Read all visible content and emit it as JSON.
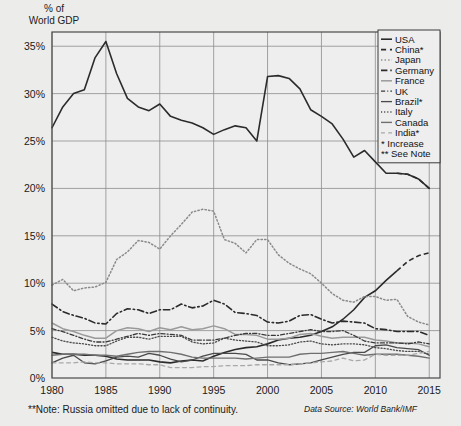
{
  "axis_title": "% of\nWorld GDP",
  "footer": {
    "note": "**Note: Russia omitted due to lack of continuity.",
    "source": "Data Source: World Bank/IMF"
  },
  "legend": {
    "entries": [
      {
        "label": "USA",
        "style": "solid",
        "color": "#2b2b2b",
        "width": 1.6
      },
      {
        "label": "China*",
        "style": "dashed",
        "color": "#2b2b2b",
        "width": 1.6
      },
      {
        "label": "Japan",
        "style": "dotted",
        "color": "#8a8a8a",
        "width": 1.5
      },
      {
        "label": "Germany",
        "style": "dashdot",
        "color": "#2b2b2b",
        "width": 1.6
      },
      {
        "label": "France",
        "style": "solid",
        "color": "#9a9a9a",
        "width": 1.5
      },
      {
        "label": "UK",
        "style": "dashdot2",
        "color": "#3a3a3a",
        "width": 1.3
      },
      {
        "label": "Brazil*",
        "style": "solid",
        "color": "#4a4a4a",
        "width": 1.3
      },
      {
        "label": "Italy",
        "style": "dotted",
        "color": "#4a4a4a",
        "width": 1.3
      },
      {
        "label": "Canada",
        "style": "solid",
        "color": "#6f6f6f",
        "width": 1.4
      },
      {
        "label": "India*",
        "style": "dashed2",
        "color": "#a8a8a8",
        "width": 1.3
      }
    ],
    "notes": [
      "* Increase",
      "** See Note"
    ]
  },
  "colors": {
    "background": "#ececeb",
    "plot_background": "#eeeeee",
    "grid": "#8d8d8d",
    "frame": "#4a4a4a",
    "text": "#1a1a1a"
  },
  "chart_data": {
    "type": "line",
    "title": "% of World GDP",
    "xlabel": "",
    "ylabel": "% of World GDP",
    "xlim": [
      1980,
      2016
    ],
    "ylim": [
      0,
      36.5
    ],
    "xticks": [
      1980,
      1985,
      1990,
      1995,
      2000,
      2005,
      2010,
      2015
    ],
    "yticks": [
      0,
      5,
      10,
      15,
      20,
      25,
      30,
      35
    ],
    "ytick_labels": [
      "0%",
      "5%",
      "10%",
      "15%",
      "20%",
      "25%",
      "30%",
      "35%"
    ],
    "grid": true,
    "legend_position": "top-right",
    "annotations": [
      "* Increase",
      "** See Note"
    ],
    "series": [
      {
        "name": "USA",
        "style": "solid",
        "x": [
          1980,
          1981,
          1982,
          1983,
          1984,
          1985,
          1986,
          1987,
          1988,
          1989,
          1990,
          1991,
          1992,
          1993,
          1994,
          1995,
          1996,
          1997,
          1998,
          1999,
          2000,
          2001,
          2002,
          2003,
          2004,
          2005,
          2006,
          2007,
          2008,
          2009,
          2010,
          2011,
          2012,
          2013,
          2014,
          2015
        ],
        "y": [
          26.4,
          28.6,
          30.0,
          30.4,
          33.8,
          35.5,
          32.1,
          29.5,
          28.6,
          28.2,
          28.9,
          27.6,
          27.2,
          26.9,
          26.4,
          25.7,
          26.2,
          26.6,
          26.4,
          25.0,
          31.8,
          31.9,
          31.6,
          30.5,
          28.3,
          27.6,
          26.8,
          25.2,
          23.3,
          24.0,
          22.8,
          21.6,
          21.6,
          21.5,
          21.0,
          20.0
        ],
        "color": "#2b2b2b"
      },
      {
        "name": "China*",
        "style": "solid-to-dashed",
        "x": [
          1980,
          1981,
          1982,
          1983,
          1984,
          1985,
          1986,
          1987,
          1988,
          1989,
          1990,
          1991,
          1992,
          1993,
          1994,
          1995,
          1996,
          1997,
          1998,
          1999,
          2000,
          2001,
          2002,
          2003,
          2004,
          2005,
          2006,
          2007,
          2008,
          2009,
          2010,
          2011,
          2012,
          2013,
          2014,
          2015
        ],
        "y": [
          2.7,
          2.5,
          2.5,
          2.4,
          2.4,
          2.3,
          2.0,
          1.9,
          1.9,
          1.9,
          1.7,
          1.6,
          1.8,
          1.9,
          1.8,
          2.3,
          2.7,
          3.0,
          3.2,
          3.3,
          3.6,
          4.0,
          4.2,
          4.3,
          4.5,
          4.9,
          5.4,
          6.2,
          7.2,
          8.5,
          9.2,
          10.3,
          11.3,
          12.3,
          12.9,
          13.2
        ],
        "color": "#2b2b2b"
      },
      {
        "name": "Japan",
        "style": "dotted",
        "x": [
          1980,
          1981,
          1982,
          1983,
          1984,
          1985,
          1986,
          1987,
          1988,
          1989,
          1990,
          1991,
          1992,
          1993,
          1994,
          1995,
          1996,
          1997,
          1998,
          1999,
          2000,
          2001,
          2002,
          2003,
          2004,
          2005,
          2006,
          2007,
          2008,
          2009,
          2010,
          2011,
          2012,
          2013,
          2014,
          2015
        ],
        "y": [
          9.8,
          10.4,
          9.2,
          9.5,
          9.6,
          10.1,
          12.5,
          13.3,
          14.5,
          14.3,
          13.6,
          15.0,
          16.2,
          17.5,
          17.8,
          17.6,
          14.6,
          14.2,
          13.2,
          14.6,
          14.6,
          13.0,
          12.1,
          11.5,
          11.0,
          10.0,
          8.9,
          8.2,
          8.0,
          8.6,
          8.6,
          8.2,
          8.3,
          6.5,
          5.9,
          5.6
        ],
        "color": "#8a8a8a"
      },
      {
        "name": "Germany",
        "style": "dashdot",
        "x": [
          1980,
          1981,
          1982,
          1983,
          1984,
          1985,
          1986,
          1987,
          1988,
          1989,
          1990,
          1991,
          1992,
          1993,
          1994,
          1995,
          1996,
          1997,
          1998,
          1999,
          2000,
          2001,
          2002,
          2003,
          2004,
          2005,
          2006,
          2007,
          2008,
          2009,
          2010,
          2011,
          2012,
          2013,
          2014,
          2015
        ],
        "y": [
          7.8,
          7.0,
          6.6,
          6.3,
          5.8,
          5.7,
          6.8,
          7.3,
          7.2,
          6.8,
          7.2,
          7.2,
          7.8,
          7.4,
          7.6,
          8.2,
          7.8,
          6.9,
          6.8,
          6.6,
          5.9,
          5.8,
          6.0,
          6.6,
          6.7,
          6.2,
          5.8,
          6.0,
          5.9,
          5.8,
          5.2,
          5.1,
          4.9,
          4.9,
          4.9,
          4.5
        ],
        "color": "#2b2b2b"
      },
      {
        "name": "France",
        "style": "solid",
        "x": [
          1980,
          1981,
          1982,
          1983,
          1984,
          1985,
          1986,
          1987,
          1988,
          1989,
          1990,
          1991,
          1992,
          1993,
          1994,
          1995,
          1996,
          1997,
          1998,
          1999,
          2000,
          2001,
          2002,
          2003,
          2004,
          2005,
          2006,
          2007,
          2008,
          2009,
          2010,
          2011,
          2012,
          2013,
          2014,
          2015
        ],
        "y": [
          5.8,
          5.2,
          4.9,
          4.5,
          4.2,
          4.2,
          5.0,
          5.3,
          5.2,
          4.9,
          5.3,
          5.1,
          5.4,
          5.1,
          5.2,
          5.5,
          5.2,
          4.6,
          4.6,
          4.5,
          4.1,
          4.1,
          4.2,
          4.6,
          4.7,
          4.4,
          4.2,
          4.3,
          4.3,
          4.3,
          4.0,
          3.9,
          3.7,
          3.7,
          3.6,
          3.3
        ],
        "color": "#9a9a9a"
      },
      {
        "name": "UK",
        "style": "dashdot2",
        "x": [
          1980,
          1981,
          1982,
          1983,
          1984,
          1985,
          1986,
          1987,
          1988,
          1989,
          1990,
          1991,
          1992,
          1993,
          1994,
          1995,
          1996,
          1997,
          1998,
          1999,
          2000,
          2001,
          2002,
          2003,
          2004,
          2005,
          2006,
          2007,
          2008,
          2009,
          2010,
          2011,
          2012,
          2013,
          2014,
          2015
        ],
        "y": [
          5.2,
          4.9,
          4.5,
          4.1,
          3.8,
          3.8,
          4.1,
          4.4,
          4.7,
          4.5,
          4.7,
          4.6,
          4.5,
          4.0,
          4.0,
          4.0,
          4.2,
          4.5,
          4.7,
          4.7,
          4.5,
          4.5,
          4.7,
          4.9,
          5.1,
          4.9,
          4.9,
          5.0,
          4.5,
          3.9,
          3.7,
          3.7,
          3.7,
          3.6,
          3.8,
          3.6
        ],
        "color": "#3a3a3a"
      },
      {
        "name": "Brazil*",
        "style": "solid",
        "x": [
          1980,
          1981,
          1982,
          1983,
          1984,
          1985,
          1986,
          1987,
          1988,
          1989,
          1990,
          1991,
          1992,
          1993,
          1994,
          1995,
          1996,
          1997,
          1998,
          1999,
          2000,
          2001,
          2002,
          2003,
          2004,
          2005,
          2006,
          2007,
          2008,
          2009,
          2010,
          2011,
          2012,
          2013,
          2014,
          2015
        ],
        "y": [
          1.6,
          2.1,
          2.4,
          1.6,
          1.5,
          1.8,
          2.2,
          2.3,
          2.2,
          2.6,
          2.4,
          2.0,
          1.7,
          1.9,
          2.3,
          2.6,
          2.6,
          2.6,
          2.5,
          1.9,
          1.9,
          1.6,
          1.4,
          1.5,
          1.6,
          1.9,
          2.2,
          2.5,
          2.7,
          2.7,
          3.4,
          3.5,
          3.2,
          3.1,
          3.0,
          2.4
        ],
        "color": "#4a4a4a"
      },
      {
        "name": "Italy",
        "style": "dotted",
        "x": [
          1980,
          1981,
          1982,
          1983,
          1984,
          1985,
          1986,
          1987,
          1988,
          1989,
          1990,
          1991,
          1992,
          1993,
          1994,
          1995,
          1996,
          1997,
          1998,
          1999,
          2000,
          2001,
          2002,
          2003,
          2004,
          2005,
          2006,
          2007,
          2008,
          2009,
          2010,
          2011,
          2012,
          2013,
          2014,
          2015
        ],
        "y": [
          4.3,
          3.9,
          3.7,
          3.6,
          3.4,
          3.4,
          3.9,
          4.3,
          4.3,
          4.1,
          4.4,
          4.4,
          4.4,
          3.8,
          3.6,
          3.7,
          4.2,
          4.0,
          3.9,
          3.8,
          3.4,
          3.4,
          3.5,
          3.8,
          3.9,
          3.6,
          3.5,
          3.6,
          3.6,
          3.5,
          3.2,
          3.1,
          2.9,
          2.8,
          2.8,
          2.5
        ],
        "color": "#4a4a4a"
      },
      {
        "name": "Canada",
        "style": "solid",
        "x": [
          1980,
          1981,
          1982,
          1983,
          1984,
          1985,
          1986,
          1987,
          1988,
          1989,
          1990,
          1991,
          1992,
          1993,
          1994,
          1995,
          1996,
          1997,
          1998,
          1999,
          2000,
          2001,
          2002,
          2003,
          2004,
          2005,
          2006,
          2007,
          2008,
          2009,
          2010,
          2011,
          2012,
          2013,
          2014,
          2015
        ],
        "y": [
          2.4,
          2.5,
          2.5,
          2.5,
          2.4,
          2.4,
          2.3,
          2.5,
          2.7,
          2.8,
          2.8,
          2.7,
          2.5,
          2.2,
          2.1,
          2.1,
          2.1,
          2.1,
          2.0,
          2.1,
          2.2,
          2.2,
          2.2,
          2.5,
          2.6,
          2.6,
          2.7,
          2.8,
          2.6,
          2.4,
          2.5,
          2.5,
          2.5,
          2.4,
          2.3,
          2.1
        ],
        "color": "#6f6f6f"
      },
      {
        "name": "India*",
        "style": "dashed2",
        "x": [
          1980,
          1981,
          1982,
          1983,
          1984,
          1985,
          1986,
          1987,
          1988,
          1989,
          1990,
          1991,
          1992,
          1993,
          1994,
          1995,
          1996,
          1997,
          1998,
          1999,
          2000,
          2001,
          2002,
          2003,
          2004,
          2005,
          2006,
          2007,
          2008,
          2009,
          2010,
          2011,
          2012,
          2013,
          2014,
          2015
        ],
        "y": [
          1.6,
          1.6,
          1.6,
          1.7,
          1.6,
          1.6,
          1.5,
          1.5,
          1.5,
          1.4,
          1.4,
          1.1,
          1.1,
          1.1,
          1.2,
          1.2,
          1.3,
          1.3,
          1.3,
          1.4,
          1.4,
          1.4,
          1.4,
          1.5,
          1.6,
          1.7,
          1.8,
          2.1,
          1.8,
          1.9,
          2.5,
          2.4,
          2.4,
          2.4,
          2.6,
          2.8
        ],
        "color": "#a8a8a8"
      }
    ]
  }
}
